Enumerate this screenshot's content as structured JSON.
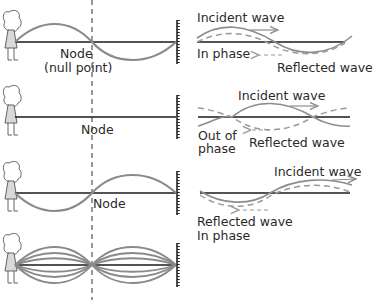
{
  "colors": {
    "string": "#1a1a1a",
    "incident_wave": "#8c8c8c",
    "reflected_wave": "#9a9a9a",
    "standing_wave": "#8a8a8a",
    "text": "#2a2a2a"
  },
  "rows": [
    {
      "left": {
        "label_line1": "Node",
        "label_line2": "(null point)"
      },
      "right": {
        "incident_label": "Incident wave",
        "reflected_label": "Reflected wave",
        "phase_label": "In phase"
      }
    },
    {
      "left": {
        "label_line1": "Node"
      },
      "right": {
        "incident_label": "Incident wave",
        "reflected_label": "Reflected wave",
        "phase_label_line1": "Out of",
        "phase_label_line2": "phase"
      }
    },
    {
      "left": {
        "label_line1": "Node"
      },
      "right": {
        "incident_label": "Incident wave",
        "reflected_label": "Reflected wave",
        "phase_label": "In phase"
      }
    },
    {
      "left": {
        "description": "standing wave envelope"
      }
    }
  ]
}
